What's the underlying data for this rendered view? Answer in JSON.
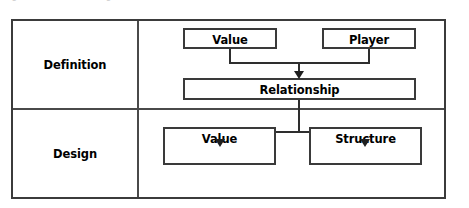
{
  "caption": {
    "text": "Figure: Framework of game value and structure"
  },
  "diagram": {
    "rows": [
      {
        "id": "definition",
        "label": "Definition",
        "boxes": [
          {
            "id": "value-definition",
            "label": "Value"
          },
          {
            "id": "player-definition",
            "label": "Player"
          },
          {
            "id": "relationship",
            "label": "Relationship"
          }
        ]
      },
      {
        "id": "design",
        "label": "Design",
        "boxes": [
          {
            "id": "value-design",
            "label": "Value"
          },
          {
            "id": "structure-design",
            "label": "Structure"
          }
        ]
      }
    ],
    "connections": [
      {
        "from": "value-definition",
        "to": "relationship",
        "arrow": true
      },
      {
        "from": "player-definition",
        "to": "relationship",
        "arrow": true
      },
      {
        "from": "relationship",
        "to": "value-design",
        "arrow": true
      },
      {
        "from": "relationship",
        "to": "structure-design",
        "arrow": true
      }
    ],
    "colors": {
      "border": "#3a3a3a",
      "connector": "#2e2e2e",
      "text": "#000000",
      "background": "#ffffff"
    }
  }
}
